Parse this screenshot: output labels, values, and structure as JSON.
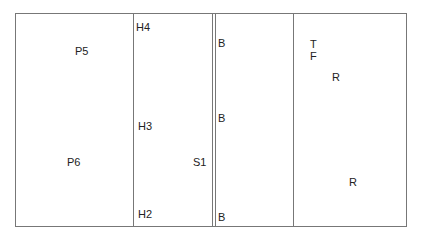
{
  "diagram": {
    "labels": {
      "p5": "P5",
      "p6": "P6",
      "h4": "H4",
      "h3": "H3",
      "h2": "H2",
      "s1": "S1",
      "b_top": "B",
      "b_mid": "B",
      "b_bot": "B",
      "t": "T",
      "f": "F",
      "r_top": "R",
      "r_bot": "R"
    }
  }
}
